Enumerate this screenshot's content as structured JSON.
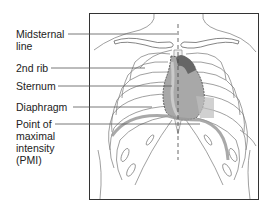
{
  "figure": {
    "labels": [
      {
        "id": "midsternal-line",
        "text": "Midsternal\nline",
        "top": 28
      },
      {
        "id": "second-rib",
        "text": "2nd rib",
        "top": 62
      },
      {
        "id": "sternum",
        "text": "Sternum",
        "top": 80
      },
      {
        "id": "diaphragm",
        "text": "Diaphragm",
        "top": 101
      },
      {
        "id": "pmi",
        "text": "Point of\nmaximal\nintensity\n(PMI)",
        "top": 118
      }
    ],
    "colors": {
      "line": "#555555",
      "frame": "#333333",
      "heart": "#8a8a8a",
      "heart_dark": "#555555",
      "diaphragm": "#9a9a9a"
    }
  }
}
